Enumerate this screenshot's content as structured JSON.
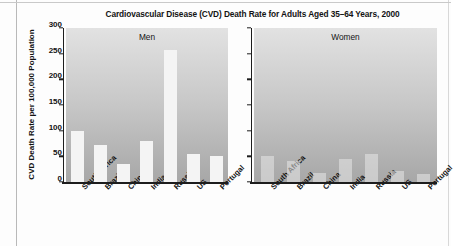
{
  "chart_data": {
    "type": "bar",
    "title": "Cardiovascular Disease (CVD) Death Rate for Adults Aged 35–64 Years, 2000",
    "xlabel": "",
    "ylabel": "CVD Death Rate per 100,000 Population",
    "ylim": [
      0,
      300
    ],
    "yticks": [
      300,
      250,
      200,
      150,
      100,
      50,
      0
    ],
    "ytick_labels": [
      "300",
      "250",
      "200",
      "150",
      "100",
      "50",
      "0"
    ],
    "grid": false,
    "legend": "none",
    "categories": [
      "South Africa",
      "Brazil",
      "China",
      "India",
      "Russia",
      "US",
      "Portugal"
    ],
    "panels": [
      {
        "label": "Men",
        "values": [
          100,
          72,
          35,
          79,
          257,
          54,
          50
        ]
      },
      {
        "label": "Women",
        "values": [
          50,
          41,
          17,
          44,
          54,
          22,
          15
        ]
      }
    ],
    "series": [
      {
        "name": "Men",
        "values": [
          100,
          72,
          35,
          79,
          257,
          54,
          50
        ]
      },
      {
        "name": "Women",
        "values": [
          50,
          41,
          17,
          44,
          54,
          22,
          15
        ]
      }
    ],
    "colors": {
      "bar": "#f4f4f4",
      "panel_background_top": "#e2e2e2",
      "panel_background_bottom": "#a7a7a7",
      "axis": "#1d1d1d",
      "text": "#131313"
    }
  }
}
